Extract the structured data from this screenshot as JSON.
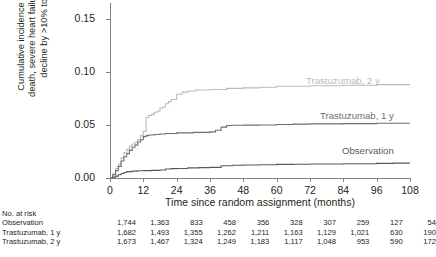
{
  "chart_data": {
    "type": "line",
    "title": "",
    "xlabel": "Time since random assignment (months)",
    "ylabel_line1": "Cumulative incidence of cardiac",
    "ylabel_line2": "death, severe heart failure or LVEF",
    "ylabel_line3": "decline by >10% to <50%",
    "xlim": [
      0,
      108
    ],
    "ylim": [
      0.0,
      0.165
    ],
    "grid": false,
    "legend_position": "in-plot-right",
    "xticks": [
      0,
      12,
      24,
      36,
      48,
      60,
      72,
      84,
      96,
      108
    ],
    "xtick_labels": [
      "0",
      "12",
      "24",
      "36",
      "48",
      "60",
      "72",
      "84",
      "96",
      "108"
    ],
    "yticks": [
      0.0,
      0.05,
      0.1,
      0.15
    ],
    "ytick_labels": [
      "0.00",
      "0.05",
      "0.10",
      "0.15"
    ],
    "series": [
      {
        "name": "Trastuzumab, 2 y",
        "color": "#b9bbbd",
        "label_x": 196,
        "label_y": 72,
        "final_value": 0.088,
        "points": [
          [
            0,
            0.0
          ],
          [
            1,
            0.004
          ],
          [
            2,
            0.009
          ],
          [
            3,
            0.013
          ],
          [
            4,
            0.019
          ],
          [
            5,
            0.024
          ],
          [
            6,
            0.027
          ],
          [
            7,
            0.03
          ],
          [
            8,
            0.032
          ],
          [
            9,
            0.034
          ],
          [
            10,
            0.036
          ],
          [
            11,
            0.04
          ],
          [
            12,
            0.044
          ],
          [
            13,
            0.057
          ],
          [
            14,
            0.059
          ],
          [
            15,
            0.06
          ],
          [
            16,
            0.062
          ],
          [
            17,
            0.063
          ],
          [
            18,
            0.066
          ],
          [
            19,
            0.067
          ],
          [
            20,
            0.07
          ],
          [
            21,
            0.072
          ],
          [
            22,
            0.074
          ],
          [
            24,
            0.079
          ],
          [
            26,
            0.081
          ],
          [
            28,
            0.082
          ],
          [
            31,
            0.083
          ],
          [
            36,
            0.0835
          ],
          [
            42,
            0.0845
          ],
          [
            48,
            0.085
          ],
          [
            54,
            0.0855
          ],
          [
            60,
            0.0865
          ],
          [
            72,
            0.087
          ],
          [
            84,
            0.0875
          ],
          [
            96,
            0.088
          ],
          [
            108,
            0.088
          ]
        ]
      },
      {
        "name": "Trastuzumab, 1 y",
        "color": "#6d6e71",
        "label_x": 210,
        "label_y": 107,
        "final_value": 0.052,
        "points": [
          [
            0,
            0.0
          ],
          [
            1,
            0.003
          ],
          [
            2,
            0.007
          ],
          [
            3,
            0.011
          ],
          [
            4,
            0.016
          ],
          [
            5,
            0.02
          ],
          [
            6,
            0.023
          ],
          [
            7,
            0.026
          ],
          [
            8,
            0.029
          ],
          [
            9,
            0.031
          ],
          [
            10,
            0.034
          ],
          [
            11,
            0.036
          ],
          [
            12,
            0.039
          ],
          [
            13,
            0.04
          ],
          [
            14,
            0.0405
          ],
          [
            16,
            0.041
          ],
          [
            18,
            0.0415
          ],
          [
            20,
            0.042
          ],
          [
            24,
            0.0425
          ],
          [
            30,
            0.043
          ],
          [
            36,
            0.0435
          ],
          [
            38,
            0.045
          ],
          [
            40,
            0.048
          ],
          [
            42,
            0.0495
          ],
          [
            44,
            0.0498
          ],
          [
            48,
            0.0499
          ],
          [
            54,
            0.05
          ],
          [
            60,
            0.0505
          ],
          [
            66,
            0.0508
          ],
          [
            72,
            0.051
          ],
          [
            84,
            0.0513
          ],
          [
            96,
            0.0516
          ],
          [
            108,
            0.052
          ]
        ]
      },
      {
        "name": "Observation",
        "color": "#58595b",
        "label_x": 232,
        "label_y": 142,
        "final_value": 0.014,
        "points": [
          [
            0,
            0.0
          ],
          [
            1,
            0.0008
          ],
          [
            2,
            0.0018
          ],
          [
            3,
            0.003
          ],
          [
            4,
            0.0042
          ],
          [
            5,
            0.0052
          ],
          [
            6,
            0.006
          ],
          [
            8,
            0.0065
          ],
          [
            10,
            0.0068
          ],
          [
            12,
            0.007
          ],
          [
            15,
            0.0072
          ],
          [
            18,
            0.0075
          ],
          [
            20,
            0.0085
          ],
          [
            22,
            0.0088
          ],
          [
            24,
            0.009
          ],
          [
            28,
            0.0095
          ],
          [
            32,
            0.0098
          ],
          [
            36,
            0.01
          ],
          [
            40,
            0.0115
          ],
          [
            44,
            0.012
          ],
          [
            48,
            0.0122
          ],
          [
            54,
            0.0125
          ],
          [
            60,
            0.0128
          ],
          [
            66,
            0.013
          ],
          [
            72,
            0.0132
          ],
          [
            84,
            0.0135
          ],
          [
            96,
            0.0138
          ],
          [
            102,
            0.014
          ],
          [
            108,
            0.014
          ]
        ]
      }
    ]
  },
  "risk_table": {
    "title": "No. at risk",
    "columns": [
      0,
      12,
      24,
      36,
      48,
      60,
      72,
      84,
      96,
      108
    ],
    "rows": [
      {
        "label": "Observation",
        "values": [
          "1,744",
          "1,363",
          "833",
          "458",
          "356",
          "328",
          "307",
          "259",
          "127",
          "54"
        ]
      },
      {
        "label": "Trastuzumab, 1 y",
        "values": [
          "1,682",
          "1,493",
          "1,355",
          "1,262",
          "1,211",
          "1,163",
          "1,129",
          "1,021",
          "630",
          "190"
        ]
      },
      {
        "label": "Trastuzumab, 2 y",
        "values": [
          "1,673",
          "1,467",
          "1,324",
          "1,249",
          "1,183",
          "1,117",
          "1,048",
          "953",
          "590",
          "172"
        ]
      }
    ]
  }
}
